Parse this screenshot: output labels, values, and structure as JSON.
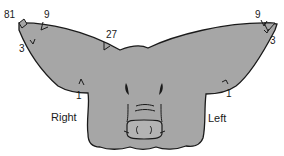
{
  "diagram": {
    "colors": {
      "head_fill": "#a6a6a6",
      "outline": "#1a1a1a",
      "background": "#ffffff",
      "snout_fill": "#b3b3b3"
    },
    "side_labels": {
      "right": "Right",
      "left": "Left"
    },
    "notch_values": {
      "right_ear_tip": "81",
      "right_ear_top_outer": "9",
      "right_ear_bottom_outer": "3",
      "right_ear_top_inner": "27",
      "right_ear_bottom_inner": "1",
      "left_ear_top": "9",
      "left_ear_bottom_outer": "3",
      "left_ear_bottom_inner": "1"
    }
  }
}
